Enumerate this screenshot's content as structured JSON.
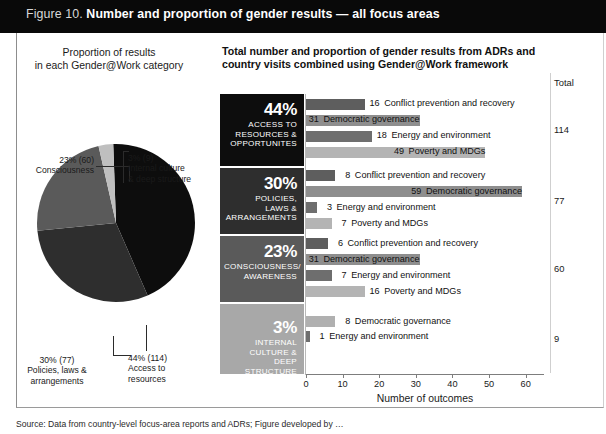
{
  "header": {
    "figure_number": "Figure 10.",
    "title": "Number and proportion of gender results — all focus areas",
    "background_color": "#090909",
    "text_color": "#ffffff"
  },
  "pie_panel": {
    "caption_line1": "Proportion of results",
    "caption_line2": "in each Gender@Work category",
    "labels": {
      "consciousness": "23% (60)\nConsciousness",
      "internal_culture": "3% (9)\nInternal culture\n& deep structure",
      "policies": "30% (77)\nPolicies, laws &\narrangements",
      "access": "44% (114)\nAccess to\nresources"
    }
  },
  "chart_panel": {
    "title": "Total number and proportion of gender results from ADRs and country visits combined using Gender@Work framework",
    "total_header": "Total",
    "xaxis_title": "Number of outcomes",
    "tick_labels": [
      "0",
      "10",
      "20",
      "30",
      "40",
      "50",
      "60"
    ]
  },
  "source_note": "Source: Data from country-level focus-area reports and ADRs; Figure developed by …",
  "chart_data": {
    "type": "bar",
    "title": "Total number and proportion of gender results from ADRs and country visits combined using Gender@Work framework",
    "xlabel": "Number of outcomes",
    "ylabel": "",
    "xlim": [
      0,
      65
    ],
    "ticks": [
      0,
      10,
      20,
      30,
      40,
      50,
      60
    ],
    "grid": false,
    "legend": "none",
    "orientation": "horizontal",
    "palette": {
      "conflict_prevention": "#5e5e5e",
      "democratic_governance": "#8e8e8e",
      "energy_environment": "#6e6e6e",
      "poverty_mdgs": "#b4b4b4",
      "pie_access": "#0d0d0d",
      "pie_policies": "#2e2e2e",
      "pie_consciousness": "#5a5a5a",
      "pie_internal": "#bfbfbf"
    },
    "pie": {
      "type": "pie",
      "title": "Proportion of results in each Gender@Work category",
      "slices": [
        {
          "label": "Access to resources",
          "percent": 44,
          "count": 114,
          "color": "#0d0d0d"
        },
        {
          "label": "Policies, laws & arrangements",
          "percent": 30,
          "count": 77,
          "color": "#2e2e2e"
        },
        {
          "label": "Consciousness",
          "percent": 23,
          "count": 60,
          "color": "#5a5a5a"
        },
        {
          "label": "Internal culture & deep structure",
          "percent": 3,
          "count": 9,
          "color": "#bfbfbf"
        }
      ]
    },
    "groups": [
      {
        "percent": "44%",
        "name": "ACCESS TO\nRESOURCES &\nOPPORTUNITES",
        "block_color": "#0d0d0d",
        "total": "114",
        "bars": [
          {
            "label": "Conflict prevention and recovery",
            "value": 16,
            "color": "#5e5e5e",
            "label_inside": false
          },
          {
            "label": "Democratic governance",
            "value": 31,
            "color": "#8e8e8e",
            "label_inside": true
          },
          {
            "label": "Energy and environment",
            "value": 18,
            "color": "#6e6e6e",
            "label_inside": false
          },
          {
            "label": "Poverty and MDGs",
            "value": 49,
            "color": "#b4b4b4",
            "label_inside": true
          }
        ]
      },
      {
        "percent": "30%",
        "name": "POLICIES,\nLAWS &\nARRANGEMENTS",
        "block_color": "#2e2e2e",
        "total": "77",
        "bars": [
          {
            "label": "Conflict prevention and recovery",
            "value": 8,
            "color": "#5e5e5e",
            "label_inside": false
          },
          {
            "label": "Democratic governance",
            "value": 59,
            "color": "#8e8e8e",
            "label_inside": true
          },
          {
            "label": "Energy and environment",
            "value": 3,
            "color": "#6e6e6e",
            "label_inside": false
          },
          {
            "label": "Poverty and MDGs",
            "value": 7,
            "color": "#b4b4b4",
            "label_inside": false
          }
        ]
      },
      {
        "percent": "23%",
        "name": "CONSCIOUSNESS/\nAWARENESS",
        "block_color": "#5a5a5a",
        "total": "60",
        "bars": [
          {
            "label": "Conflict prevention and recovery",
            "value": 6,
            "color": "#5e5e5e",
            "label_inside": false
          },
          {
            "label": "Democratic governance",
            "value": 31,
            "color": "#8e8e8e",
            "label_inside": true
          },
          {
            "label": "Energy and environment",
            "value": 7,
            "color": "#6e6e6e",
            "label_inside": false
          },
          {
            "label": "Poverty and MDGs",
            "value": 16,
            "color": "#b4b4b4",
            "label_inside": false
          }
        ]
      },
      {
        "percent": "3%",
        "name": "INTERNAL\nCULTURE & DEEP\nSTRUCTURE",
        "block_color": "#a8a8a8",
        "total": "9",
        "bars": [
          {
            "label": "Democratic governance",
            "value": 8,
            "color": "#b0b0b0",
            "label_inside": false
          },
          {
            "label": "Energy and environment",
            "value": 1,
            "color": "#6e6e6e",
            "label_inside": false
          }
        ]
      }
    ]
  }
}
